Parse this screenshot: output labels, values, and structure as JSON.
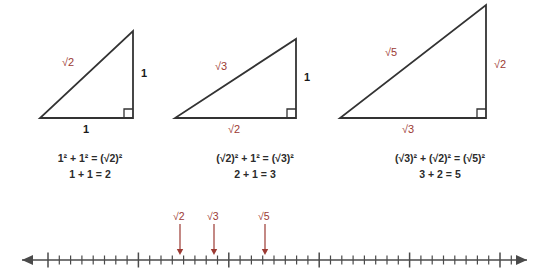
{
  "figure": {
    "stroke_color": "#333333",
    "label_color": "#9c3a33",
    "text_color": "#2b2b2b"
  },
  "triangles": [
    {
      "id": "triangle-1",
      "hypotenuse_label": "√2",
      "vertical_leg_label": "1",
      "horizontal_leg_label": "1",
      "hypotenuse_label_color": "#9c3a33",
      "vertical_leg_label_color": "#1a1a1a",
      "horizontal_leg_label_color": "#1a1a1a",
      "equation_line1": "1² + 1² = (√2)²",
      "equation_line2": "1 + 1 = 2",
      "geometry": {
        "left_x": 40,
        "right_x": 133,
        "base_y": 118,
        "apex_y": 31
      }
    },
    {
      "id": "triangle-2",
      "hypotenuse_label": "√3",
      "vertical_leg_label": "1",
      "horizontal_leg_label": "√2",
      "hypotenuse_label_color": "#9c3a33",
      "vertical_leg_label_color": "#1a1a1a",
      "horizontal_leg_label_color": "#9c3a33",
      "equation_line1": "(√2)² + 1² = (√3)²",
      "equation_line2": "2 + 1 = 3",
      "geometry": {
        "left_x": 175,
        "right_x": 296,
        "base_y": 118,
        "apex_y": 39
      }
    },
    {
      "id": "triangle-3",
      "hypotenuse_label": "√5",
      "vertical_leg_label": "√2",
      "horizontal_leg_label": "√3",
      "hypotenuse_label_color": "#9c3a33",
      "vertical_leg_label_color": "#9c3a33",
      "horizontal_leg_label_color": "#9c3a33",
      "equation_line1": "(√3)² + (√2)² = (√5)²",
      "equation_line2": "3 + 2 = 5",
      "geometry": {
        "left_x": 340,
        "right_x": 486,
        "base_y": 118,
        "apex_y": 5
      }
    }
  ],
  "number_line": {
    "axis_y": 260,
    "left_end_x": 22,
    "right_end_x": 527,
    "tick_start_x": 48,
    "tick_spacing_px": 11.3,
    "tick_count": 43,
    "major_tick_every": 8,
    "minor_tick_height": 9,
    "major_tick_height": 15,
    "arrow_both_ends": true,
    "markers": [
      {
        "label": "√2",
        "x": 180,
        "color": "#9c3a33"
      },
      {
        "label": "√3",
        "x": 214,
        "color": "#9c3a33"
      },
      {
        "label": "√5",
        "x": 265,
        "color": "#9c3a33"
      }
    ]
  }
}
